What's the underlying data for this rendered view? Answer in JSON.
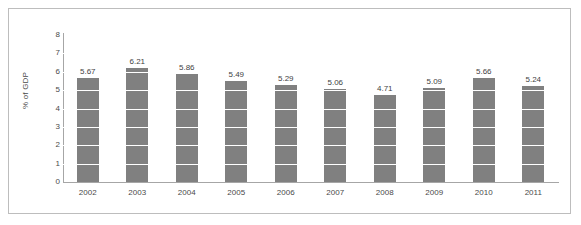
{
  "chart_data": {
    "type": "bar",
    "title": "",
    "subtitle": "",
    "xlabel": "",
    "ylabel": "% of GDP",
    "categories": [
      "2002",
      "2003",
      "2004",
      "2005",
      "2006",
      "2007",
      "2008",
      "2009",
      "2010",
      "2011"
    ],
    "values": [
      5.67,
      6.21,
      5.86,
      5.49,
      5.29,
      5.06,
      4.71,
      5.09,
      5.66,
      5.24
    ],
    "data_labels": [
      "5.67",
      "6.21",
      "5.86",
      "5.49",
      "5.29",
      "5.06",
      "4.71",
      "5.09",
      "5.66",
      "5.24"
    ],
    "ylim": [
      0,
      8
    ],
    "ytick_labels": [
      "8",
      "7",
      "6",
      "5",
      "4",
      "3",
      "2",
      "1",
      "0"
    ],
    "ytick_values": [
      8,
      7,
      6,
      5,
      4,
      3,
      2,
      1,
      0
    ],
    "grid": true,
    "grid_orientation": "horizontal",
    "grid_color": "#ffffff",
    "legend": null,
    "legend_position": "none",
    "bar_color": "#808080",
    "axis_color": "#a6a6a6",
    "text_color": "#4a4a4a",
    "background": "#ffffff",
    "border_color": "#bdbdbd"
  }
}
